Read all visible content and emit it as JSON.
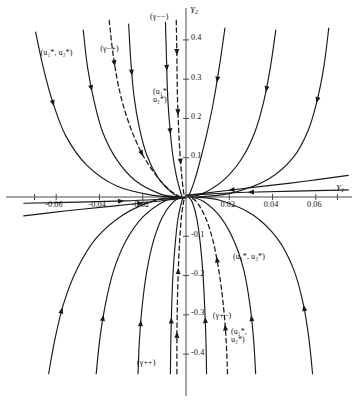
{
  "chart_data": {
    "type": "line",
    "title": "",
    "xlabel": "Y1",
    "ylabel": "Y2",
    "xlim": [
      -0.075,
      0.075
    ],
    "ylim": [
      -0.47,
      0.47
    ],
    "grid": false,
    "legend": "none",
    "xticks": [
      {
        "value": -0.06,
        "label": "-0.06"
      },
      {
        "value": -0.04,
        "label": "-0.04"
      },
      {
        "value": -0.02,
        "label": "-0.02"
      },
      {
        "value": 0.02,
        "label": "0.02"
      },
      {
        "value": 0.04,
        "label": "0.04"
      },
      {
        "value": 0.06,
        "label": "0.06"
      }
    ],
    "yticks": [
      {
        "value": 0.4,
        "label": "0.4"
      },
      {
        "value": 0.3,
        "label": "0.3"
      },
      {
        "value": 0.2,
        "label": "0.2"
      },
      {
        "value": 0.1,
        "label": "0.1"
      },
      {
        "value": -0.1,
        "label": "-0.1"
      },
      {
        "value": -0.2,
        "label": "-0.2"
      },
      {
        "value": -0.3,
        "label": "-0.3"
      },
      {
        "value": -0.4,
        "label": "-0.4"
      }
    ],
    "annotations": [
      {
        "id": "gamma-minus-minus",
        "text": "(γ−−)",
        "x": -0.012,
        "y": 0.455,
        "style": "dashed-branch-label"
      },
      {
        "id": "gamma-minus-plus",
        "text": "(γ−+)",
        "x": -0.035,
        "y": 0.375,
        "style": "dashed-branch-label"
      },
      {
        "id": "gamma-plus-plus",
        "text": "(γ++)",
        "x": -0.018,
        "y": -0.425,
        "style": "dashed-branch-label"
      },
      {
        "id": "gamma-plus-minus",
        "text": "(γ+−)",
        "x": 0.017,
        "y": -0.305,
        "style": "dashed-branch-label"
      },
      {
        "id": "equilibrium-upper-left",
        "text": "(u₁*, u₂*)",
        "x": -0.058,
        "y": 0.365,
        "style": "equilibrium-label"
      },
      {
        "id": "equilibrium-center-upper",
        "text": "(u₁*, u₂*)",
        "x": -0.006,
        "y": 0.265,
        "style": "equilibrium-label-stacked"
      },
      {
        "id": "equilibrium-lower-right",
        "text": "(u₁*, u₂*)",
        "x": 0.031,
        "y": -0.155,
        "style": "equilibrium-label"
      },
      {
        "id": "equilibrium-bottom-right",
        "text": "(u₁*, u₂*)",
        "x": 0.03,
        "y": -0.345,
        "style": "equilibrium-label-stacked"
      }
    ],
    "series": [
      {
        "name": "upper-left-orbit-1",
        "kind": "solid",
        "points": [
          [
            -0.0695,
            0.42
          ],
          [
            -0.066,
            0.33
          ],
          [
            -0.0615,
            0.24
          ],
          [
            -0.0555,
            0.155
          ],
          [
            -0.046,
            0.082
          ],
          [
            -0.032,
            0.028
          ],
          [
            -0.015,
            0.004
          ],
          [
            -0.0035,
            0.0
          ]
        ]
      },
      {
        "name": "upper-left-orbit-2",
        "kind": "solid",
        "points": [
          [
            -0.0475,
            0.425
          ],
          [
            -0.0455,
            0.33
          ],
          [
            -0.0425,
            0.245
          ],
          [
            -0.0385,
            0.165
          ],
          [
            -0.032,
            0.095
          ],
          [
            -0.0235,
            0.042
          ],
          [
            -0.012,
            0.008
          ],
          [
            -0.0035,
            0.0
          ]
        ]
      },
      {
        "name": "upper-left-orbit-3",
        "kind": "solid",
        "points": [
          [
            -0.0265,
            0.44
          ],
          [
            -0.0255,
            0.345
          ],
          [
            -0.024,
            0.255
          ],
          [
            -0.0215,
            0.175
          ],
          [
            -0.018,
            0.105
          ],
          [
            -0.013,
            0.05
          ],
          [
            -0.007,
            0.013
          ],
          [
            -0.003,
            0.0
          ]
        ]
      },
      {
        "name": "upper-center-orbit",
        "kind": "solid",
        "points": [
          [
            -0.0095,
            0.445
          ],
          [
            -0.009,
            0.35
          ],
          [
            -0.0085,
            0.26
          ],
          [
            -0.0075,
            0.18
          ],
          [
            -0.0062,
            0.11
          ],
          [
            -0.0045,
            0.055
          ],
          [
            -0.0028,
            0.018
          ],
          [
            -0.0018,
            0.0
          ]
        ]
      },
      {
        "name": "upper-right-orbit-1",
        "kind": "solid",
        "points": [
          [
            0.018,
            0.43
          ],
          [
            0.0155,
            0.335
          ],
          [
            0.0128,
            0.245
          ],
          [
            0.0098,
            0.165
          ],
          [
            0.0068,
            0.098
          ],
          [
            0.0042,
            0.046
          ],
          [
            0.002,
            0.012
          ],
          [
            0.0008,
            0.0
          ]
        ]
      },
      {
        "name": "upper-right-orbit-2",
        "kind": "solid",
        "points": [
          [
            0.0415,
            0.425
          ],
          [
            0.039,
            0.33
          ],
          [
            0.036,
            0.245
          ],
          [
            0.0318,
            0.165
          ],
          [
            0.0258,
            0.098
          ],
          [
            0.018,
            0.046
          ],
          [
            0.009,
            0.012
          ],
          [
            0.002,
            0.0
          ]
        ]
      },
      {
        "name": "upper-right-orbit-3",
        "kind": "solid",
        "points": [
          [
            0.066,
            0.43
          ],
          [
            0.0638,
            0.335
          ],
          [
            0.0608,
            0.25
          ],
          [
            0.0565,
            0.17
          ],
          [
            0.0495,
            0.1
          ],
          [
            0.038,
            0.045
          ],
          [
            0.021,
            0.01
          ],
          [
            0.005,
            0.0
          ]
        ]
      },
      {
        "name": "lower-left-orbit-1",
        "kind": "solid",
        "points": [
          [
            -0.0635,
            -0.45
          ],
          [
            -0.0605,
            -0.36
          ],
          [
            -0.0565,
            -0.27
          ],
          [
            -0.0505,
            -0.185
          ],
          [
            -0.0415,
            -0.105
          ],
          [
            -0.029,
            -0.045
          ],
          [
            -0.014,
            -0.008
          ],
          [
            -0.0035,
            0.0
          ]
        ]
      },
      {
        "name": "lower-left-orbit-2",
        "kind": "solid",
        "points": [
          [
            -0.0415,
            -0.45
          ],
          [
            -0.0398,
            -0.36
          ],
          [
            -0.0372,
            -0.272
          ],
          [
            -0.0335,
            -0.188
          ],
          [
            -0.0278,
            -0.112
          ],
          [
            -0.0198,
            -0.05
          ],
          [
            -0.0098,
            -0.01
          ],
          [
            -0.003,
            0.0
          ]
        ]
      },
      {
        "name": "lower-left-orbit-3",
        "kind": "solid",
        "points": [
          [
            -0.0222,
            -0.45
          ],
          [
            -0.0215,
            -0.362
          ],
          [
            -0.0202,
            -0.275
          ],
          [
            -0.0182,
            -0.192
          ],
          [
            -0.0152,
            -0.115
          ],
          [
            -0.011,
            -0.052
          ],
          [
            -0.0058,
            -0.012
          ],
          [
            -0.002,
            0.0
          ]
        ]
      },
      {
        "name": "lower-center-orbit",
        "kind": "solid",
        "points": [
          [
            -0.0072,
            -0.45
          ],
          [
            -0.007,
            -0.362
          ],
          [
            -0.0066,
            -0.278
          ],
          [
            -0.006,
            -0.195
          ],
          [
            -0.005,
            -0.12
          ],
          [
            -0.0038,
            -0.058
          ],
          [
            -0.0022,
            -0.016
          ],
          [
            -0.0012,
            0.0
          ]
        ]
      },
      {
        "name": "lower-right-orbit-1",
        "kind": "solid",
        "points": [
          [
            0.0095,
            -0.45
          ],
          [
            0.0092,
            -0.36
          ],
          [
            0.0086,
            -0.275
          ],
          [
            0.0078,
            -0.192
          ],
          [
            0.0066,
            -0.118
          ],
          [
            0.005,
            -0.055
          ],
          [
            0.003,
            -0.014
          ],
          [
            0.0012,
            0.0
          ]
        ]
      },
      {
        "name": "lower-right-orbit-2",
        "kind": "solid",
        "points": [
          [
            0.0322,
            -0.45
          ],
          [
            0.0312,
            -0.36
          ],
          [
            0.0295,
            -0.272
          ],
          [
            0.0268,
            -0.188
          ],
          [
            0.0222,
            -0.112
          ],
          [
            0.0158,
            -0.05
          ],
          [
            0.008,
            -0.011
          ],
          [
            0.0022,
            0.0
          ]
        ]
      },
      {
        "name": "lower-right-orbit-3",
        "kind": "solid",
        "points": [
          [
            0.0585,
            -0.45
          ],
          [
            0.0568,
            -0.36
          ],
          [
            0.0542,
            -0.272
          ],
          [
            0.0498,
            -0.185
          ],
          [
            0.0425,
            -0.108
          ],
          [
            0.031,
            -0.046
          ],
          [
            0.016,
            -0.009
          ],
          [
            0.004,
            0.0
          ]
        ]
      },
      {
        "name": "incoming-axis-right-1",
        "kind": "solid",
        "points": [
          [
            0.075,
            0.055
          ],
          [
            0.055,
            0.04
          ],
          [
            0.035,
            0.027
          ],
          [
            0.018,
            0.016
          ],
          [
            0.006,
            0.008
          ],
          [
            0.0,
            0.004
          ]
        ]
      },
      {
        "name": "incoming-axis-right-2",
        "kind": "solid",
        "points": [
          [
            0.075,
            0.018
          ],
          [
            0.05,
            0.015
          ],
          [
            0.028,
            0.012
          ],
          [
            0.012,
            0.008
          ],
          [
            0.0,
            0.004
          ]
        ]
      },
      {
        "name": "incoming-axis-left-1",
        "kind": "solid",
        "points": [
          [
            -0.075,
            -0.048
          ],
          [
            -0.055,
            -0.035
          ],
          [
            -0.035,
            -0.024
          ],
          [
            -0.018,
            -0.014
          ],
          [
            -0.006,
            -0.006
          ],
          [
            0.0,
            -0.002
          ]
        ]
      },
      {
        "name": "incoming-axis-left-2",
        "kind": "solid",
        "points": [
          [
            -0.075,
            -0.016
          ],
          [
            -0.05,
            -0.013
          ],
          [
            -0.028,
            -0.01
          ],
          [
            -0.012,
            -0.006
          ],
          [
            0.0,
            -0.002
          ]
        ]
      },
      {
        "name": "separatrix-gamma-minus-plus",
        "kind": "dashed",
        "points": [
          [
            -0.0355,
            0.45
          ],
          [
            -0.0335,
            0.355
          ],
          [
            -0.0305,
            0.265
          ],
          [
            -0.0262,
            0.185
          ],
          [
            -0.0205,
            0.112
          ],
          [
            -0.0138,
            0.055
          ],
          [
            -0.0072,
            0.016
          ],
          [
            -0.0025,
            0.0
          ]
        ]
      },
      {
        "name": "separatrix-gamma-minus-minus",
        "kind": "dashed",
        "points": [
          [
            -0.0045,
            0.45
          ],
          [
            -0.0042,
            0.355
          ],
          [
            -0.004,
            0.265
          ],
          [
            -0.0035,
            0.185
          ],
          [
            -0.0028,
            0.112
          ],
          [
            -0.002,
            0.055
          ],
          [
            -0.0012,
            0.016
          ],
          [
            -0.0006,
            0.0
          ]
        ]
      },
      {
        "name": "separatrix-gamma-plus-plus",
        "kind": "dashed",
        "points": [
          [
            -0.0042,
            -0.45
          ],
          [
            -0.0042,
            -0.36
          ],
          [
            -0.004,
            -0.275
          ],
          [
            -0.0036,
            -0.192
          ],
          [
            -0.003,
            -0.118
          ],
          [
            -0.0022,
            -0.056
          ],
          [
            -0.0012,
            -0.015
          ],
          [
            -0.0006,
            0.0
          ]
        ]
      },
      {
        "name": "separatrix-gamma-plus-minus",
        "kind": "dashed",
        "points": [
          [
            0.0192,
            -0.45
          ],
          [
            0.0185,
            -0.36
          ],
          [
            0.0172,
            -0.272
          ],
          [
            0.0152,
            -0.188
          ],
          [
            0.0125,
            -0.112
          ],
          [
            0.009,
            -0.052
          ],
          [
            0.0048,
            -0.012
          ],
          [
            0.0015,
            0.0
          ]
        ]
      }
    ],
    "arrows": [
      {
        "on": "upper-left-orbit-1",
        "t": 0.3,
        "dir": "down"
      },
      {
        "on": "upper-left-orbit-2",
        "t": 0.28,
        "dir": "down"
      },
      {
        "on": "upper-left-orbit-3",
        "t": 0.26,
        "dir": "down"
      },
      {
        "on": "upper-center-orbit",
        "t": 0.26,
        "dir": "down"
      },
      {
        "on": "upper-center-orbit",
        "t": 0.62,
        "dir": "down"
      },
      {
        "on": "upper-right-orbit-1",
        "t": 0.3,
        "dir": "down"
      },
      {
        "on": "upper-right-orbit-2",
        "t": 0.3,
        "dir": "down"
      },
      {
        "on": "upper-right-orbit-3",
        "t": 0.3,
        "dir": "down"
      },
      {
        "on": "lower-left-orbit-1",
        "t": 0.27,
        "dir": "up"
      },
      {
        "on": "lower-left-orbit-2",
        "t": 0.27,
        "dir": "up"
      },
      {
        "on": "lower-left-orbit-3",
        "t": 0.27,
        "dir": "up"
      },
      {
        "on": "lower-center-orbit",
        "t": 0.3,
        "dir": "up"
      },
      {
        "on": "lower-right-orbit-1",
        "t": 0.3,
        "dir": "up"
      },
      {
        "on": "lower-right-orbit-2",
        "t": 0.28,
        "dir": "up"
      },
      {
        "on": "lower-right-orbit-3",
        "t": 0.28,
        "dir": "up"
      },
      {
        "on": "incoming-axis-right-1",
        "t": 0.72,
        "dir": "left"
      },
      {
        "on": "incoming-axis-right-2",
        "t": 0.6,
        "dir": "left"
      },
      {
        "on": "incoming-axis-left-1",
        "t": 0.72,
        "dir": "right"
      },
      {
        "on": "incoming-axis-left-2",
        "t": 0.6,
        "dir": "right"
      },
      {
        "on": "separatrix-gamma-minus-plus",
        "t": 0.22,
        "dir": "down"
      },
      {
        "on": "separatrix-gamma-minus-plus",
        "t": 0.7,
        "dir": "down"
      },
      {
        "on": "separatrix-gamma-minus-minus",
        "t": 0.18,
        "dir": "down"
      },
      {
        "on": "separatrix-gamma-minus-minus",
        "t": 0.52,
        "dir": "down"
      },
      {
        "on": "separatrix-gamma-minus-minus",
        "t": 0.8,
        "dir": "down"
      },
      {
        "on": "separatrix-gamma-plus-plus",
        "t": 0.22,
        "dir": "up"
      },
      {
        "on": "separatrix-gamma-plus-plus",
        "t": 0.58,
        "dir": "up"
      },
      {
        "on": "separatrix-gamma-plus-minus",
        "t": 0.25,
        "dir": "up"
      },
      {
        "on": "separatrix-gamma-plus-minus",
        "t": 0.62,
        "dir": "up"
      }
    ]
  },
  "axes": {
    "x_axis_label": "Y",
    "x_axis_sub": "1",
    "y_axis_label": "Y",
    "y_axis_sub": "2"
  },
  "colors": {
    "ink": "#1a1a1a",
    "axis": "#4a4a4a",
    "background": "#ffffff"
  }
}
